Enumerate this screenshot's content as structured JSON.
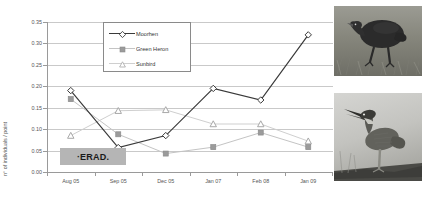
{
  "chart_data": {
    "type": "line",
    "title": "",
    "xlabel": "",
    "ylabel": "n° of individuals / point",
    "categories": [
      "Aug 05",
      "Sep 05",
      "Dec 05",
      "Jan 07",
      "Feb 08",
      "Jan 09"
    ],
    "ylim": [
      0.0,
      0.35
    ],
    "ytick_step": 0.05,
    "yticks": [
      "0.00",
      "0.05",
      "0.10",
      "0.15",
      "0.20",
      "0.25",
      "0.30",
      "0.35"
    ],
    "grid": "horizontal",
    "legend_position": "top-center",
    "series": [
      {
        "name": "Moorhen",
        "color": "#3a3a3a",
        "marker": "open-diamond",
        "values": [
          0.19,
          0.057,
          0.085,
          0.195,
          0.168,
          0.32
        ]
      },
      {
        "name": "Green Heron",
        "color": "#9b9b9b",
        "marker": "filled-square",
        "values": [
          0.17,
          0.088,
          0.043,
          0.058,
          0.092,
          0.058
        ]
      },
      {
        "name": "Sunbird",
        "color": "#b9b9b9",
        "marker": "open-triangle",
        "values": [
          0.085,
          0.143,
          0.145,
          0.112,
          0.112,
          0.072
        ]
      }
    ],
    "annotations": [
      {
        "name": "eradication-marker",
        "text": "·ERAD.",
        "style": "gray-box"
      }
    ]
  },
  "photos": [
    {
      "name": "moorhen-photo",
      "caption": ""
    },
    {
      "name": "green-heron-photo",
      "caption": ""
    }
  ],
  "colors": {
    "moorhen": "#3a3a3a",
    "green_heron": "#9b9b9b",
    "sunbird": "#b9b9b9",
    "grid": "#c9c9c9",
    "axis": "#9a9a9a",
    "erad_box": "#b5b5b5"
  }
}
